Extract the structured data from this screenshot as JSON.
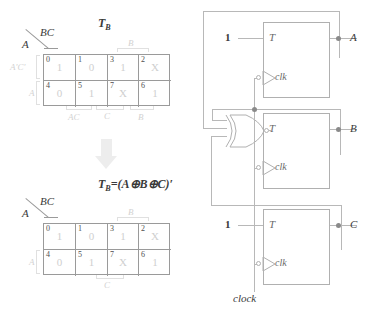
{
  "kmap_top": {
    "title": "T",
    "title_sub": "B",
    "col_header": "BC",
    "row_header": "A",
    "row_label_faint": "A'C'",
    "row_label_2": "A",
    "group_top": "B",
    "group_bottom_1": "AC",
    "group_bottom_2": "C",
    "group_bottom_3": "B",
    "cells": [
      {
        "index": "0",
        "value": "1"
      },
      {
        "index": "1",
        "value": "0"
      },
      {
        "index": "3",
        "value": "1"
      },
      {
        "index": "2",
        "value": "X"
      },
      {
        "index": "4",
        "value": "0"
      },
      {
        "index": "5",
        "value": "1"
      },
      {
        "index": "7",
        "value": "X"
      },
      {
        "index": "6",
        "value": "1"
      }
    ]
  },
  "arrow": {
    "name": "down-arrow"
  },
  "kmap_bottom": {
    "title": "T",
    "title_sub": "B",
    "equals": "=(A⊕B⊕C)′",
    "col_header": "BC",
    "row_header": "A",
    "row_label_2": "A",
    "group_top": "B",
    "group_bottom": "C",
    "cells": [
      {
        "index": "0",
        "value": "1"
      },
      {
        "index": "1",
        "value": "0"
      },
      {
        "index": "3",
        "value": "1"
      },
      {
        "index": "2",
        "value": "X"
      },
      {
        "index": "4",
        "value": "0"
      },
      {
        "index": "5",
        "value": "1"
      },
      {
        "index": "7",
        "value": "X"
      },
      {
        "index": "6",
        "value": "1"
      }
    ]
  },
  "circuit": {
    "flipflops": [
      {
        "t_label": "T",
        "clk_label": "clk",
        "input": "1",
        "output": "A"
      },
      {
        "t_label": "T",
        "clk_label": "clk",
        "input": "",
        "output": "B"
      },
      {
        "t_label": "T",
        "clk_label": "clk",
        "input": "1",
        "output": "C"
      }
    ],
    "gate": {
      "type": "xnor",
      "name": "xnor-gate"
    },
    "clock_label": "clock"
  },
  "colors": {
    "grid": "#9a9a9a",
    "cell_value": "#cfcfcf",
    "index": "#4f4f4f",
    "wire": "#b8b8b8",
    "arrow": "#ededed",
    "text": "#3a3a3a"
  }
}
